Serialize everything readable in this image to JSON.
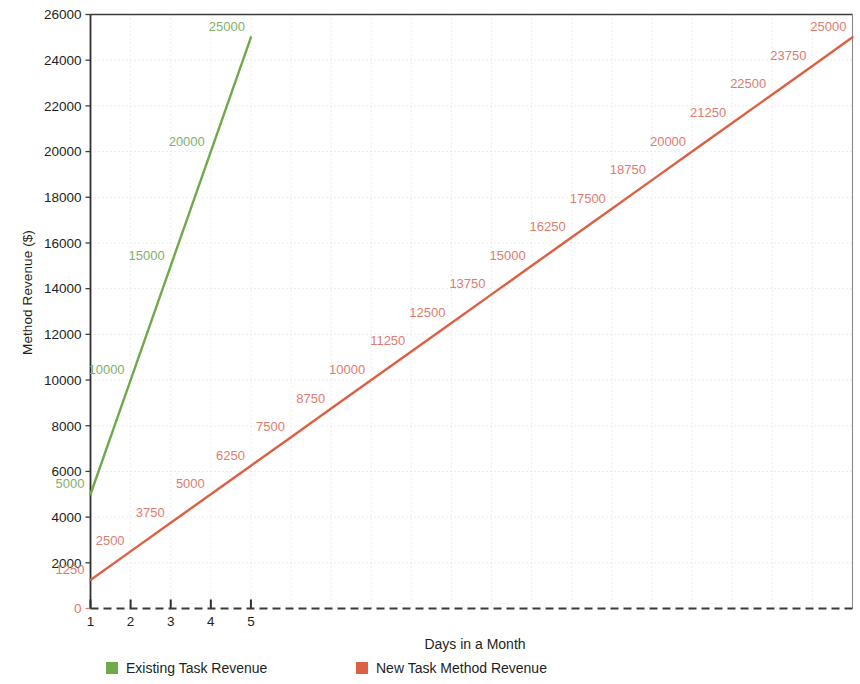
{
  "chart_data": {
    "type": "line",
    "title": "",
    "xlabel": "Days in a Month",
    "ylabel": "Method Revenue ($)",
    "x": [
      1,
      2,
      3,
      4,
      5,
      6,
      7,
      8,
      9,
      10,
      11,
      12,
      13,
      14,
      15,
      16,
      17,
      18,
      19,
      20
    ],
    "xlim": [
      1,
      20
    ],
    "ylim": [
      0,
      26000
    ],
    "xticks": [
      "1",
      "2",
      "3",
      "4",
      "5"
    ],
    "xtick_values": [
      1,
      2,
      3,
      4,
      5
    ],
    "yticks": [
      "0",
      "2000",
      "4000",
      "6000",
      "8000",
      "10000",
      "12000",
      "14000",
      "16000",
      "18000",
      "20000",
      "22000",
      "24000",
      "26000"
    ],
    "ytick_values": [
      0,
      2000,
      4000,
      6000,
      8000,
      10000,
      12000,
      14000,
      16000,
      18000,
      20000,
      22000,
      24000,
      26000
    ],
    "grid": true,
    "legend_position": "bottom",
    "series": [
      {
        "name": "Existing Task Revenue",
        "color": "#6faa4a",
        "x": [
          1,
          2,
          3,
          4,
          5
        ],
        "values": [
          5000,
          10000,
          15000,
          20000,
          25000
        ],
        "labels": [
          "5000",
          "10000",
          "15000",
          "20000",
          "25000"
        ],
        "label_color": "#7fb069"
      },
      {
        "name": "New Task Method Revenue",
        "color": "#dd5f44",
        "x": [
          1,
          2,
          3,
          4,
          5,
          6,
          7,
          8,
          9,
          10,
          11,
          12,
          13,
          14,
          15,
          16,
          17,
          18,
          19,
          20
        ],
        "values": [
          1250,
          2500,
          3750,
          5000,
          6250,
          7500,
          8750,
          10000,
          11250,
          12500,
          13750,
          15000,
          16250,
          17500,
          18750,
          20000,
          21250,
          22500,
          23750,
          25000
        ],
        "labels": [
          "1250",
          "2500",
          "3750",
          "5000",
          "6250",
          "7500",
          "8750",
          "10000",
          "11250",
          "12500",
          "13750",
          "15000",
          "16250",
          "17500",
          "18750",
          "20000",
          "21250",
          "22500",
          "23750",
          "25000"
        ],
        "label_color": "#dc7d70"
      }
    ],
    "baseline": {
      "name": "zero-baseline",
      "value": 0,
      "style": "dashed",
      "color": "#3a3a3a"
    }
  },
  "legend": {
    "items": [
      {
        "label": "Existing Task Revenue",
        "color": "#6faa4a"
      },
      {
        "label": "New Task Method Revenue",
        "color": "#dd5f44"
      }
    ]
  },
  "axes": {
    "x_title": "Days in a Month",
    "y_title": "Method Revenue ($)"
  }
}
